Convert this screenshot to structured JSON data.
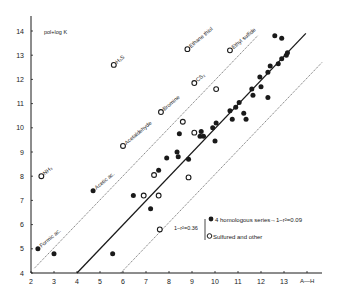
{
  "chart_data": {
    "type": "scatter",
    "title": "",
    "xlabel": "A—H",
    "ylabel": "pol+log K",
    "xlim": [
      2,
      14
    ],
    "ylim": [
      4,
      14.5
    ],
    "x_ticks": [
      "2",
      "3",
      "4",
      "5",
      "6",
      "7",
      "8",
      "9",
      "10",
      "11",
      "12",
      "13"
    ],
    "y_ticks": [
      "4",
      "5",
      "6",
      "7",
      "8",
      "9",
      "10",
      "11",
      "12",
      "13",
      "14"
    ],
    "grid": false,
    "legend": {
      "position": "lower-right",
      "bracket_label": "1−r²=0.36",
      "entries": [
        {
          "marker": "filled-circle",
          "label": "4 homologous series",
          "note": "1−r²=0.09"
        },
        {
          "marker": "open-circle",
          "label": "Sulfured and other"
        }
      ]
    },
    "series": [
      {
        "name": "4 homologous series",
        "marker": "filled",
        "points": [
          {
            "x": 2.3,
            "y": 5.0,
            "label": "Formic ac."
          },
          {
            "x": 3.0,
            "y": 4.8
          },
          {
            "x": 4.7,
            "y": 7.4,
            "label": "Acetic ac."
          },
          {
            "x": 5.55,
            "y": 4.8
          },
          {
            "x": 6.45,
            "y": 7.2
          },
          {
            "x": 7.2,
            "y": 6.65
          },
          {
            "x": 7.55,
            "y": 8.25
          },
          {
            "x": 7.9,
            "y": 8.75
          },
          {
            "x": 8.4,
            "y": 8.8
          },
          {
            "x": 8.85,
            "y": 8.7
          },
          {
            "x": 8.45,
            "y": 9.75
          },
          {
            "x": 8.35,
            "y": 9.0
          },
          {
            "x": 9.35,
            "y": 9.65
          },
          {
            "x": 9.4,
            "y": 9.85
          },
          {
            "x": 9.5,
            "y": 9.65
          },
          {
            "x": 9.9,
            "y": 10.0
          },
          {
            "x": 10.05,
            "y": 10.2
          },
          {
            "x": 10.0,
            "y": 9.45
          },
          {
            "x": 10.75,
            "y": 10.35
          },
          {
            "x": 10.65,
            "y": 10.7
          },
          {
            "x": 10.9,
            "y": 10.85
          },
          {
            "x": 11.05,
            "y": 11.05
          },
          {
            "x": 11.25,
            "y": 10.6
          },
          {
            "x": 11.35,
            "y": 10.35
          },
          {
            "x": 11.65,
            "y": 11.35
          },
          {
            "x": 11.6,
            "y": 11.6
          },
          {
            "x": 12.0,
            "y": 11.7
          },
          {
            "x": 11.95,
            "y": 12.1
          },
          {
            "x": 12.3,
            "y": 11.25
          },
          {
            "x": 12.3,
            "y": 12.3
          },
          {
            "x": 12.4,
            "y": 12.55
          },
          {
            "x": 12.75,
            "y": 12.65
          },
          {
            "x": 12.9,
            "y": 12.85
          },
          {
            "x": 12.6,
            "y": 13.8
          },
          {
            "x": 12.9,
            "y": 13.7
          },
          {
            "x": 13.1,
            "y": 13.0
          },
          {
            "x": 13.15,
            "y": 13.1
          }
        ]
      },
      {
        "name": "Sulfured and other",
        "marker": "open",
        "points": [
          {
            "x": 2.45,
            "y": 8.0,
            "label": "NH₃"
          },
          {
            "x": 5.6,
            "y": 12.6,
            "label": "H₂S"
          },
          {
            "x": 6.0,
            "y": 9.25,
            "label": "Acetaldehyde"
          },
          {
            "x": 7.65,
            "y": 10.65,
            "label": "Bromine"
          },
          {
            "x": 9.1,
            "y": 11.85,
            "label": "CS₂"
          },
          {
            "x": 8.8,
            "y": 13.25,
            "label": "Ethane thiol"
          },
          {
            "x": 10.65,
            "y": 13.2,
            "label": "Ethyl sulfide"
          },
          {
            "x": 10.05,
            "y": 11.6
          },
          {
            "x": 8.6,
            "y": 10.25
          },
          {
            "x": 9.1,
            "y": 9.8
          },
          {
            "x": 7.35,
            "y": 8.05
          },
          {
            "x": 8.85,
            "y": 7.95
          },
          {
            "x": 6.9,
            "y": 7.2
          },
          {
            "x": 7.55,
            "y": 7.2
          },
          {
            "x": 7.6,
            "y": 5.8
          }
        ]
      }
    ],
    "lines": [
      {
        "name": "regression",
        "style": "solid",
        "from": {
          "x": 4.0,
          "y": 4.0
        },
        "to": {
          "x": 13.95,
          "y": 13.9
        }
      },
      {
        "name": "upper-band",
        "style": "dotted",
        "from": {
          "x": 2.15,
          "y": 4.2
        },
        "to": {
          "x": 11.85,
          "y": 13.8
        }
      },
      {
        "name": "lower-band",
        "style": "dotted",
        "from": {
          "x": 5.9,
          "y": 4.0
        },
        "to": {
          "x": 14.65,
          "y": 12.7
        }
      }
    ]
  },
  "axis": {
    "ylabel": "pol+log K",
    "xlabel": "A—H"
  },
  "annotations": {
    "band_label": "1−r²=0.36",
    "legend_filled": "4 homologous series",
    "legend_filled_note": "→1−r²=0.09",
    "legend_open": "Sulfured and other"
  }
}
